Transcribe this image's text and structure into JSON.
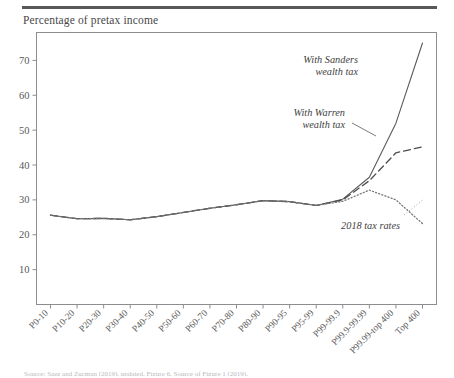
{
  "figure": {
    "axis_title": "Percentage of pretax income",
    "caption_partial": "Source: Saez and Zucman (2019), updated. Figure 6. Source of Figure 1 (2019)."
  },
  "chart_data": {
    "type": "line",
    "title": "Percentage of pretax income",
    "xlabel": "",
    "ylabel": "Percentage of pretax income",
    "ylim": [
      0,
      78
    ],
    "yticks": [
      10,
      20,
      30,
      40,
      50,
      60,
      70
    ],
    "grid": false,
    "legend_position": "inline-annotations",
    "categories": [
      "P0-10",
      "P10-20",
      "P20-30",
      "P30-40",
      "P40-50",
      "P50-60",
      "P60-70",
      "P70-80",
      "P80-90",
      "P90-95",
      "P95-99",
      "P99-99.9",
      "P99.9-99.99",
      "P99.99-top 400",
      "Top 400"
    ],
    "series": [
      {
        "name": "With Sanders wealth tax",
        "style": "solid",
        "color": "#5a5a5c",
        "values": [
          25.6,
          24.6,
          24.7,
          24.3,
          25.2,
          26.4,
          27.6,
          28.6,
          29.8,
          29.5,
          28.4,
          30.2,
          36.5,
          52.0,
          75.0
        ]
      },
      {
        "name": "With Warren wealth tax",
        "style": "dashed",
        "color": "#4d4d50",
        "values": [
          25.6,
          24.6,
          24.7,
          24.3,
          25.2,
          26.4,
          27.6,
          28.6,
          29.8,
          29.5,
          28.4,
          30.0,
          35.5,
          43.5,
          45.2
        ]
      },
      {
        "name": "2018 tax rates",
        "style": "dotted",
        "color": "#76767a",
        "values": [
          25.6,
          24.6,
          24.7,
          24.3,
          25.2,
          26.4,
          27.6,
          28.6,
          29.8,
          29.5,
          28.4,
          29.6,
          32.8,
          30.0,
          23.2
        ]
      }
    ],
    "annotations": [
      {
        "text_line1": "With Sanders",
        "text_line2": "wealth tax"
      },
      {
        "text_line1": "With Warren",
        "text_line2": "wealth tax"
      },
      {
        "text_line1": "2018 tax rates",
        "text_line2": ""
      }
    ]
  }
}
